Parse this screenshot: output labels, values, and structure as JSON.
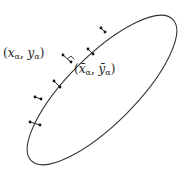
{
  "diagram": {
    "title": "",
    "ellipse": {
      "cx": 102,
      "cy": 90,
      "rx": 100,
      "ry": 34,
      "rotation": -45,
      "stroke": "#333333"
    },
    "labels": {
      "point": {
        "text": "(x_α, y_α)",
        "x_var": "x",
        "y_var": "y",
        "sub": "α"
      },
      "projection": {
        "text": "(x̄_α, ȳ_α)",
        "x_var": "x̄",
        "y_var": "ȳ",
        "sub": "α"
      }
    },
    "data_points": [
      {
        "on": [
          105,
          32
        ],
        "off": [
          101,
          28
        ]
      },
      {
        "on": [
          88,
          49
        ],
        "off": [
          93,
          54
        ]
      },
      {
        "on": [
          71,
          62
        ],
        "off": [
          63,
          55
        ]
      },
      {
        "on": [
          54,
          81
        ],
        "off": [
          60,
          87
        ]
      },
      {
        "on": [
          41,
          99
        ],
        "off": [
          35,
          97
        ]
      },
      {
        "on": [
          30,
          122
        ],
        "off": [
          40,
          125
        ]
      }
    ],
    "highlighted_point": {
      "on": [
        71,
        62
      ],
      "off": [
        63,
        55
      ]
    }
  }
}
